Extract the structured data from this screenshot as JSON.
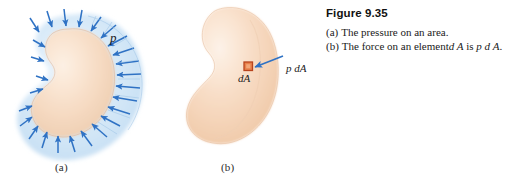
{
  "figure": {
    "caption_title": "Figure 9.35",
    "caption_lines": [
      {
        "lead": "(a)",
        "text": "The pressure on an area."
      },
      {
        "lead": "(b)",
        "text": "The force on an element dA is p dA."
      }
    ],
    "caption_line_a_lead": "(a)",
    "caption_line_a_text": "The pressure on an area.",
    "caption_line_b_lead": "(b)",
    "caption_line_b_text_1": "The force on an element",
    "caption_line_b_math_1": "d A",
    "caption_line_b_text_2": "is",
    "caption_line_b_math_2": "p d A",
    "caption_line_b_period": "."
  },
  "panel_a": {
    "sublabel": "(a)",
    "pressure_label": "p",
    "description": "Blue halo region surrounding a peach area, with blue arrows pointing inward onto the area boundary",
    "arrow_count": 26,
    "colors": {
      "halo_fill": "#cfe4f5",
      "halo_fill_light": "#e7f1fb",
      "area_fill": "#f5d5bd",
      "area_fill_light": "#fae6d6",
      "arrow": "#2f72c4",
      "arrow_dark": "#1f5aa8"
    }
  },
  "panel_b": {
    "sublabel": "(b)",
    "element_label": "dA",
    "force_label": "p dA",
    "description": "Peach kidney-shaped area with a small orange square element dA and a blue force arrow",
    "colors": {
      "area_fill": "#f7dcc6",
      "area_fill_light": "#fdf0e5",
      "area_edge": "#e8c2a4",
      "element_fill": "#e8804a",
      "element_border": "#b8431c",
      "arrow": "#2f72c4"
    }
  },
  "page": {
    "background": "#ffffff",
    "text_color": "#1a1a1a"
  }
}
